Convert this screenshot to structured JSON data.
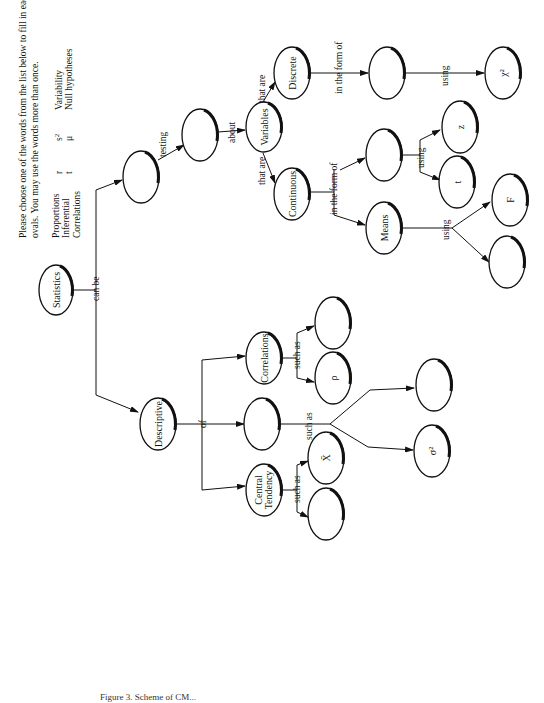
{
  "instructions": {
    "line1": "Please choose one of the words from the list below to fill in each of the blank",
    "line2": "ovals.  You may use the words more than once.",
    "word_bank": {
      "col1": [
        "Proportions",
        "Inferential",
        "Correlations"
      ],
      "col2": [
        "r",
        "t"
      ],
      "col3": [
        "s2",
        "μ"
      ],
      "col4": [
        "Variability",
        "Null hypotheses"
      ]
    }
  },
  "nodes": {
    "statistics": "Statistics",
    "descriptive": "Descriptive",
    "inferential_blank": "",
    "testing_blank": "",
    "variables": "Variables",
    "discrete": "Discrete",
    "discrete_form_blank": "",
    "chi_square": "χ²",
    "continuous": "Continuous",
    "continuous_form_blank": "",
    "z": "z",
    "t": "t",
    "means": "Means",
    "f": "F",
    "means_using_blank": "",
    "correlations": "Correlations",
    "correlations_blank": "",
    "rho": "ρ",
    "variability_blank": "",
    "variability_example_blank": "",
    "sigma_square": "σ²",
    "central_tendency_1": "Central",
    "central_tendency_2": "Tendency",
    "x_bar": "X̄",
    "central_example_blank": ""
  },
  "links": {
    "can_be": "can be",
    "testing": "testing",
    "about": "about",
    "that_are_discrete": "that are",
    "that_are_continuous": "that are",
    "in_the_form_of_discrete": "in the form of",
    "using_discrete": "using",
    "in_the_form_of_continuous": "in the form of",
    "using_continuous": "using",
    "using_means": "using",
    "of": "of",
    "such_as_correlations": "such as",
    "such_as_variability": "such as",
    "such_as_central": "such as"
  },
  "caption": "Figure 3.  Scheme of CM..."
}
